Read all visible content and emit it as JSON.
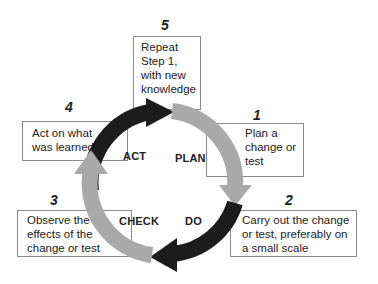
{
  "diagram": {
    "colors": {
      "dark_arc": "#1c1c1c",
      "light_arc": "#a9a9a9",
      "box_border": "#8a8a8a"
    },
    "phases": {
      "act": "ACT",
      "plan": "PLAN",
      "do": "DO",
      "check": "CHECK"
    },
    "steps": [
      {
        "number": "1",
        "lines": [
          "Plan a",
          "change or",
          "test"
        ]
      },
      {
        "number": "2",
        "lines": [
          "Carry out the change",
          "or test, preferably on",
          "a small scale"
        ]
      },
      {
        "number": "3",
        "lines": [
          "Observe the",
          "effects of the",
          "change or test"
        ]
      },
      {
        "number": "4",
        "lines": [
          "Act on what",
          "was learned"
        ]
      },
      {
        "number": "5",
        "lines": [
          "Repeat",
          "Step 1,",
          "with new",
          "knowledge"
        ]
      }
    ]
  }
}
